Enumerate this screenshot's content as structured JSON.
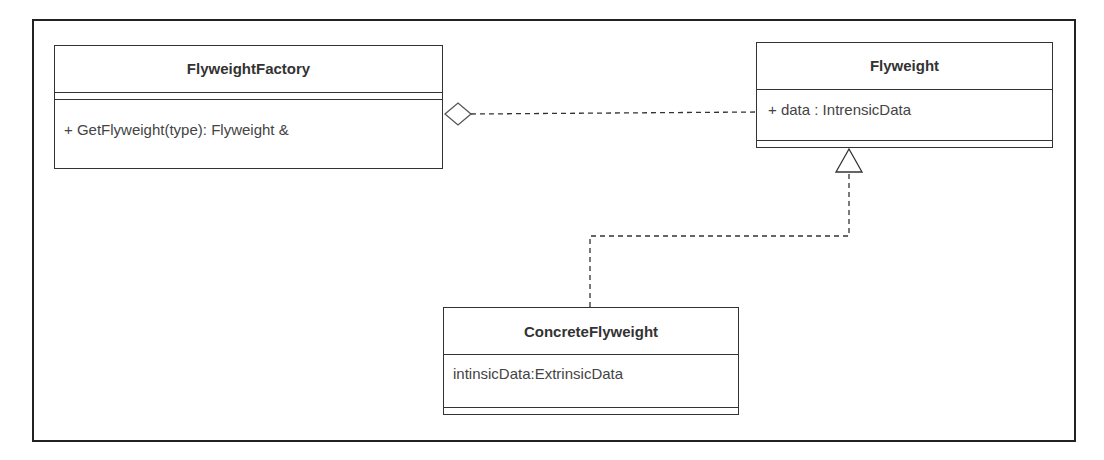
{
  "diagram": {
    "type": "UML class diagram",
    "classes": [
      {
        "id": "flyweight-factory",
        "name": "FlyweightFactory",
        "attributes": [],
        "operations": [
          "+ GetFlyweight(type): Flyweight &"
        ]
      },
      {
        "id": "flyweight",
        "name": "Flyweight",
        "attributes": [
          "+ data : IntrensicData"
        ],
        "operations": []
      },
      {
        "id": "concrete-flyweight",
        "name": "ConcreteFlyweight",
        "attributes": [
          "intinsicData:ExtrinsicData"
        ],
        "operations": []
      }
    ],
    "relationships": [
      {
        "type": "aggregation",
        "from": "FlyweightFactory",
        "to": "Flyweight",
        "style": "dashed",
        "end_marker": "hollow-diamond at FlyweightFactory"
      },
      {
        "type": "realization",
        "from": "ConcreteFlyweight",
        "to": "Flyweight",
        "style": "dashed",
        "end_marker": "hollow-triangle at Flyweight"
      }
    ],
    "colors": {
      "line": "#333333",
      "text": "#444444",
      "background": "#ffffff"
    }
  }
}
